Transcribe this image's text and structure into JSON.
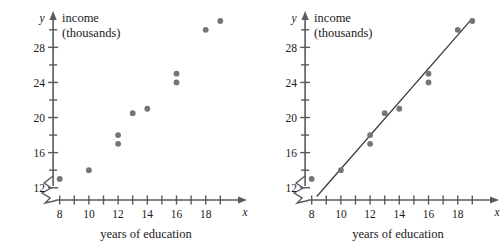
{
  "figure": {
    "axis_color": "#5a5a5e",
    "dot_color": "#76747a",
    "line_color": "#3c3c40",
    "text_color": "#1a1a1a"
  },
  "chart_data": [
    {
      "type": "scatter",
      "title": "",
      "xlabel": "years of education",
      "ylabel": "income",
      "ylabel_sub": "(thousands)",
      "x_axis_symbol": "x",
      "y_axis_symbol": "y",
      "xlim": [
        7.2,
        19.8
      ],
      "ylim": [
        10.6,
        31.8
      ],
      "xticks": [
        8,
        9,
        10,
        11,
        12,
        13,
        14,
        15,
        16,
        17,
        18,
        19
      ],
      "xtick_labels": [
        "8",
        "",
        "10",
        "",
        "12",
        "",
        "14",
        "",
        "16",
        "",
        "18",
        ""
      ],
      "yticks": [
        12,
        14,
        16,
        18,
        20,
        22,
        24,
        26,
        28,
        30
      ],
      "ytick_labels": [
        "12",
        "",
        "16",
        "",
        "20",
        "",
        "24",
        "",
        "28",
        ""
      ],
      "axis_break": true,
      "grid": false,
      "legend": "none",
      "points": [
        {
          "x": 8,
          "y": 13
        },
        {
          "x": 10,
          "y": 14
        },
        {
          "x": 12,
          "y": 18
        },
        {
          "x": 12,
          "y": 17
        },
        {
          "x": 13,
          "y": 20.5
        },
        {
          "x": 14,
          "y": 21
        },
        {
          "x": 16,
          "y": 25
        },
        {
          "x": 16,
          "y": 24
        },
        {
          "x": 18,
          "y": 30
        },
        {
          "x": 19,
          "y": 31
        }
      ]
    },
    {
      "type": "scatter",
      "title": "",
      "xlabel": "years of education",
      "ylabel": "income",
      "ylabel_sub": "(thousands)",
      "x_axis_symbol": "x",
      "y_axis_symbol": "y",
      "xlim": [
        7.2,
        19.8
      ],
      "ylim": [
        10.6,
        31.8
      ],
      "xticks": [
        8,
        9,
        10,
        11,
        12,
        13,
        14,
        15,
        16,
        17,
        18,
        19
      ],
      "xtick_labels": [
        "8",
        "",
        "10",
        "",
        "12",
        "",
        "14",
        "",
        "16",
        "",
        "18",
        ""
      ],
      "yticks": [
        12,
        14,
        16,
        18,
        20,
        22,
        24,
        26,
        28,
        30
      ],
      "ytick_labels": [
        "12",
        "",
        "16",
        "",
        "20",
        "",
        "24",
        "",
        "28",
        ""
      ],
      "axis_break": true,
      "grid": false,
      "legend": "none",
      "points": [
        {
          "x": 8,
          "y": 13
        },
        {
          "x": 10,
          "y": 14
        },
        {
          "x": 12,
          "y": 18
        },
        {
          "x": 12,
          "y": 17
        },
        {
          "x": 13,
          "y": 20.5
        },
        {
          "x": 14,
          "y": 21
        },
        {
          "x": 16,
          "y": 25
        },
        {
          "x": 16,
          "y": 24
        },
        {
          "x": 18,
          "y": 30
        },
        {
          "x": 19,
          "y": 31
        }
      ],
      "trend_line": {
        "x0": 8.35,
        "y0": 11.0,
        "x1": 19.0,
        "y1": 31.3
      }
    }
  ]
}
